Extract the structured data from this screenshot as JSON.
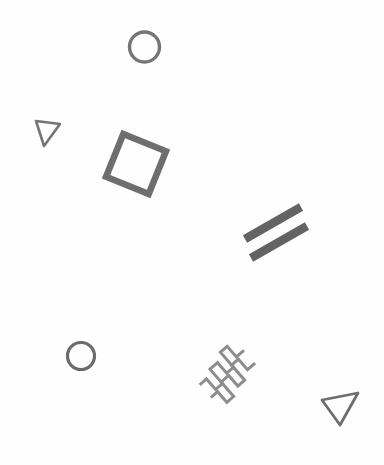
{
  "canvas": {
    "width": 384,
    "height": 465,
    "background_color": "#fefefe",
    "title": "Abstract gray geometric shapes on white background"
  },
  "palette": {
    "dark_gray": "#636363",
    "medium_gray": "#757575",
    "light_gray": "#8d8d8d"
  },
  "shapes": [
    {
      "id": "circle-top",
      "kind": "circle",
      "label": "Circle outline",
      "cx": 144.5,
      "cy": 47,
      "r": 15,
      "stroke_width": 3.4,
      "color": "#757575",
      "fill": "none"
    },
    {
      "id": "triangle-upper-left",
      "kind": "triangle",
      "label": "Small triangle outline pointing right",
      "points": "36,121 60,124 44,146",
      "stroke_width": 2.6,
      "color": "#757575",
      "fill": "none",
      "rotation_deg": 0
    },
    {
      "id": "square-rotated",
      "kind": "square",
      "label": "Rotated square outline",
      "cx": 136,
      "cy": 164,
      "size": 46,
      "rotation_deg": 22,
      "stroke_width": 6.5,
      "color": "#6e6e6e",
      "fill": "none"
    },
    {
      "id": "bar-upper",
      "kind": "bar",
      "label": "Thick diagonal bar, upper",
      "x1": 245,
      "y1": 239,
      "x2": 301,
      "y2": 207,
      "stroke_width": 8.5,
      "color": "#636363"
    },
    {
      "id": "bar-lower",
      "kind": "bar",
      "label": "Thick diagonal bar, lower",
      "x1": 251,
      "y1": 258,
      "x2": 307,
      "y2": 226,
      "stroke_width": 8.5,
      "color": "#636363"
    },
    {
      "id": "circle-bottom-left",
      "kind": "circle",
      "label": "Circle outline, lower left",
      "cx": 81,
      "cy": 356,
      "r": 13.5,
      "stroke_width": 3.2,
      "color": "#6b6b6b",
      "fill": "none"
    },
    {
      "id": "zigzag-front",
      "kind": "zigzag",
      "label": "Staircase zigzag polyline, front",
      "points": "202,380 211,380 211,394 220,394 220,375 230,375 230,389 239,389 239,369 248,369 248,383 258,383",
      "rotation_deg": -41,
      "stroke_width": 3,
      "color": "#8d8d8d",
      "fill": "none"
    },
    {
      "id": "zigzag-back",
      "kind": "zigzag",
      "label": "Staircase zigzag polyline, back",
      "points": "202,363 211,363 211,377 220,377 220,358 230,358 230,372 239,372 239,352 248,352 248,366 258,366",
      "rotation_deg": -41,
      "stroke_width": 3,
      "color": "#8d8d8d",
      "fill": "none"
    },
    {
      "id": "triangle-bottom-right",
      "kind": "triangle",
      "label": "Triangle outline pointing down left",
      "points": "322,400 358,393 340,425",
      "stroke_width": 2.8,
      "color": "#6e6e6e",
      "fill": "none",
      "rotation_deg": 0
    }
  ]
}
